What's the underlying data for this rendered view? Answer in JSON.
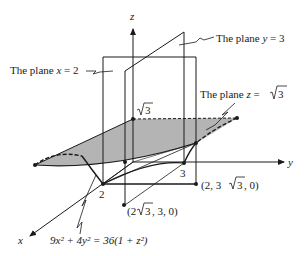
{
  "figure": {
    "axes": {
      "x": "x",
      "y": "y",
      "z": "z"
    },
    "labels": {
      "plane_y": "The plane y = 3",
      "plane_y_prefix": "The plane ",
      "plane_y_var": "y",
      "plane_y_eq": " = 3",
      "plane_x_prefix": "The plane ",
      "plane_x_var": "x",
      "plane_x_eq": " = 2",
      "plane_z_prefix": "The plane ",
      "plane_z_var": "z",
      "plane_z_eq": " = ",
      "plane_z_val": "3",
      "sqrt3_top": "3",
      "point_2": "2",
      "point_3": "3",
      "point_a_prefix": "(2, 3",
      "point_a_rad": "3",
      "point_a_suffix": ", 0)",
      "point_b_prefix": "(2",
      "point_b_rad": "3",
      "point_b_suffix": ", 3, 0)",
      "equation": "9x² + 4y² = 36(1 + z²)"
    },
    "colors": {
      "stroke": "#1a1a1a",
      "shade": "#b4b4b4"
    }
  }
}
